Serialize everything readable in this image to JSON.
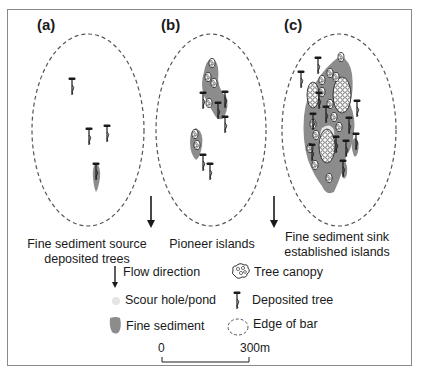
{
  "figure": {
    "panels": [
      {
        "id": "a",
        "label": "(a)",
        "caption_line1": "Fine sediment source",
        "caption_line2": "deposited trees"
      },
      {
        "id": "b",
        "label": "(b)",
        "caption_line1": "Pioneer islands",
        "caption_line2": ""
      },
      {
        "id": "c",
        "label": "(c)",
        "caption_line1": "Fine sediment sink",
        "caption_line2": "established islands"
      }
    ],
    "legend": {
      "items": [
        {
          "icon": "flow-arrow-icon",
          "label": "Flow direction"
        },
        {
          "icon": "tree-canopy-icon",
          "label": "Tree canopy"
        },
        {
          "icon": "scour-hole-icon",
          "label": "Scour hole/pond"
        },
        {
          "icon": "deposited-tree-icon",
          "label": "Deposited tree"
        },
        {
          "icon": "fine-sediment-icon",
          "label": "Fine sediment"
        },
        {
          "icon": "bar-edge-icon",
          "label": "Edge of bar"
        }
      ]
    },
    "scale_bar": {
      "start_label": "0",
      "end_label": "300m"
    },
    "colors": {
      "fine_sediment": "#8c8c8c",
      "scour_hole": "#e4e4e4",
      "frame": "#8a8a8a",
      "ink": "#1a1a1a"
    }
  }
}
